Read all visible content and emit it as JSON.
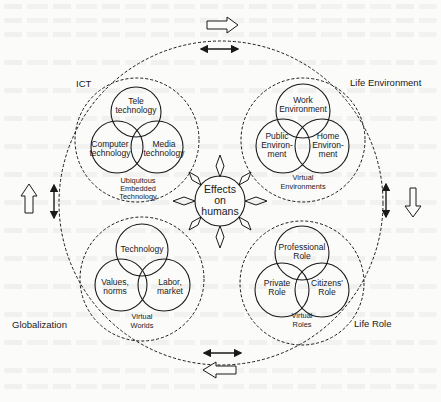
{
  "figure": {
    "center": {
      "label_lines": [
        "Effects",
        "on",
        "humans"
      ]
    },
    "outer_ring_labels": {
      "top_left": "ICT",
      "top_right": "Life Environment",
      "bottom_left": "Globalization",
      "bottom_right": "Life Role"
    },
    "quadrants": [
      {
        "id": "ict",
        "circles": [
          {
            "lines": [
              "Tele",
              "technology"
            ]
          },
          {
            "lines": [
              "Computer",
              "technology"
            ]
          },
          {
            "lines": [
              "Media",
              "technology"
            ]
          }
        ],
        "footer_lines": [
          "Ubiquitous",
          "Embedded",
          "Technology"
        ]
      },
      {
        "id": "life-environment",
        "circles": [
          {
            "lines": [
              "Work",
              "Environment"
            ]
          },
          {
            "lines": [
              "Public",
              "Environ-",
              "ment"
            ]
          },
          {
            "lines": [
              "Home",
              "Environ-",
              "ment"
            ]
          }
        ],
        "footer_lines": [
          "Virtual",
          "Environments"
        ]
      },
      {
        "id": "globalization",
        "circles": [
          {
            "lines": [
              "Technology"
            ]
          },
          {
            "lines": [
              "Values,",
              "norms"
            ]
          },
          {
            "lines": [
              "Labor,",
              "market"
            ]
          }
        ],
        "footer_lines": [
          "Virtual",
          "Worlds"
        ]
      },
      {
        "id": "life-role",
        "circles": [
          {
            "lines": [
              "Professional",
              "Role"
            ]
          },
          {
            "lines": [
              "Private",
              "Role"
            ]
          },
          {
            "lines": [
              "Citizens'",
              "Role"
            ]
          }
        ],
        "footer_lines": [
          "Virtual",
          "Roles"
        ]
      }
    ],
    "flow_arrows": {
      "top": "right",
      "right": "down",
      "bottom": "left",
      "left": "up"
    },
    "colors": {
      "ink": "#1a1a1a",
      "paper": "#fbfbfa"
    }
  }
}
